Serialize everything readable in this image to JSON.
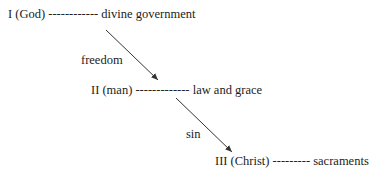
{
  "nodes": [
    {
      "label": "I (God) ------------ divine government"
    },
    {
      "label": "II (man) ------------- law and grace"
    },
    {
      "label": "III (Christ) --------- sacraments"
    }
  ],
  "edges": [
    {
      "label": "freedom"
    },
    {
      "label": "sin"
    }
  ]
}
